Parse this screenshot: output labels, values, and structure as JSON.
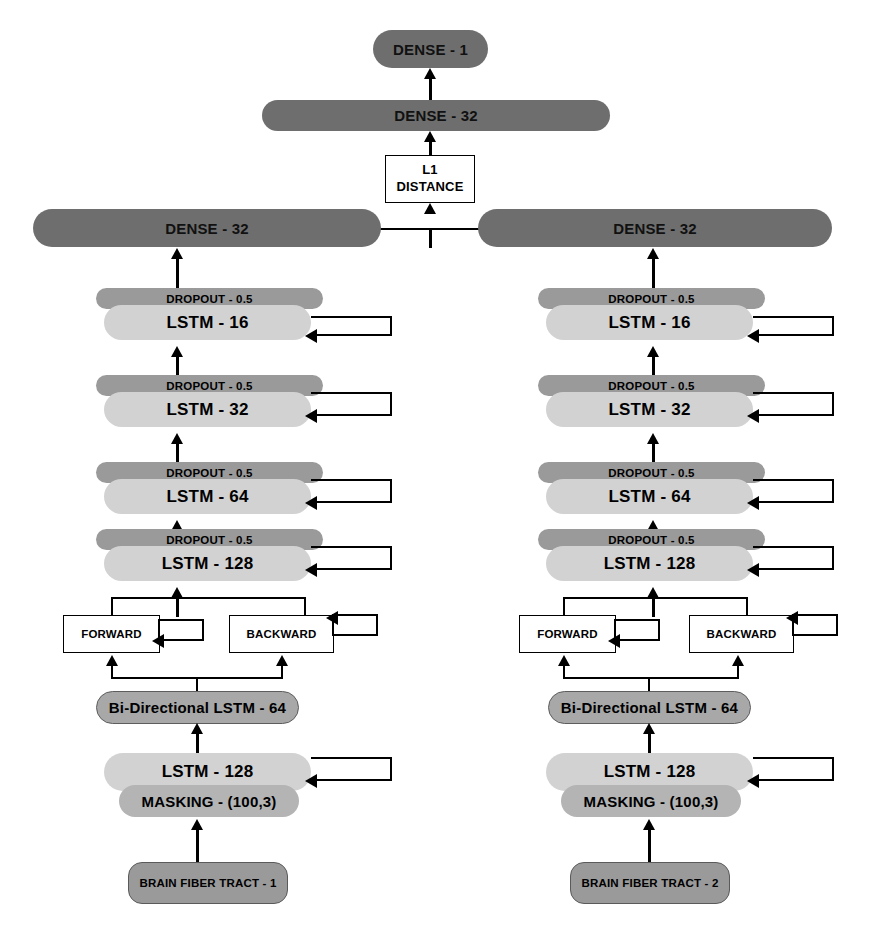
{
  "diagram": {
    "merge": {
      "l1_line1": "L1",
      "l1_line2": "DISTANCE"
    },
    "head": {
      "dense_out": "DENSE - 1",
      "dense_merge": "DENSE - 32"
    },
    "branches": [
      {
        "id": "left",
        "dense": "DENSE - 32",
        "stack": [
          {
            "dropout": "DROPOUT - 0.5",
            "lstm": "LSTM - 16"
          },
          {
            "dropout": "DROPOUT - 0.5",
            "lstm": "LSTM - 32"
          },
          {
            "dropout": "DROPOUT - 0.5",
            "lstm": "LSTM - 64"
          },
          {
            "dropout": "DROPOUT - 0.5",
            "lstm": "LSTM - 128"
          }
        ],
        "forward": "FORWARD",
        "backward": "BACKWARD",
        "bidirectional": "Bi-Directional LSTM - 64",
        "lstm_base": "LSTM - 128",
        "masking": "MASKING - (100,3)",
        "input": "BRAIN FIBER TRACT - 1"
      },
      {
        "id": "right",
        "dense": "DENSE - 32",
        "stack": [
          {
            "dropout": "DROPOUT - 0.5",
            "lstm": "LSTM - 16"
          },
          {
            "dropout": "DROPOUT - 0.5",
            "lstm": "LSTM - 32"
          },
          {
            "dropout": "DROPOUT - 0.5",
            "lstm": "LSTM - 64"
          },
          {
            "dropout": "DROPOUT - 0.5",
            "lstm": "LSTM - 128"
          }
        ],
        "forward": "FORWARD",
        "backward": "BACKWARD",
        "bidirectional": "Bi-Directional LSTM - 64",
        "lstm_base": "LSTM - 128",
        "masking": "MASKING - (100,3)",
        "input": "BRAIN FIBER TRACT - 2"
      }
    ],
    "colors": {
      "dense": "#6e6e6e",
      "dropout": "#9a9a9a",
      "lstm": "#d2d2d2",
      "bidirectional": "#a8a8a8",
      "masking": "#b4b4b4",
      "input": "#9a9a9a",
      "box": "#ffffff",
      "stroke": "#000000",
      "background": "#ffffff"
    }
  }
}
